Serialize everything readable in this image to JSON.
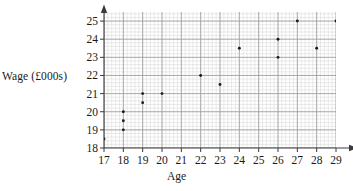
{
  "chart_data": {
    "type": "scatter",
    "title": "",
    "xlabel": "Age",
    "ylabel": "Wage (£000s)",
    "xlim": [
      17,
      29
    ],
    "ylim": [
      18,
      25.5
    ],
    "xticks": [
      17,
      18,
      19,
      20,
      21,
      22,
      23,
      24,
      25,
      26,
      27,
      28,
      29
    ],
    "yticks": [
      18,
      19,
      20,
      21,
      22,
      23,
      24,
      25
    ],
    "xtick_labels": [
      "17",
      "18",
      "19",
      "20",
      "21",
      "22",
      "23",
      "24",
      "25",
      "26",
      "27",
      "28",
      "29"
    ],
    "ytick_labels": [
      "18",
      "19",
      "20",
      "21",
      "22",
      "23",
      "24",
      "25"
    ],
    "grid": true,
    "minor_grid": true,
    "minor_subdivisions": 5,
    "legend": null,
    "marker": "dot",
    "marker_color": "#1a1a1a",
    "grid_major_color": "#9a9a9a",
    "grid_minor_color": "#d5d5d5",
    "axis_color": "#3a3a3a",
    "background_color": "#ffffff",
    "x": [
      17,
      18,
      18,
      18,
      19,
      19,
      20,
      22,
      23,
      24,
      26,
      26,
      27,
      28,
      29
    ],
    "y": [
      18.5,
      19,
      19.5,
      20,
      20.5,
      21,
      21,
      22,
      21.5,
      23.5,
      23,
      24,
      25,
      23.5,
      25
    ],
    "points": [
      {
        "age": 17,
        "wage": 18.5
      },
      {
        "age": 18,
        "wage": 19
      },
      {
        "age": 18,
        "wage": 19.5
      },
      {
        "age": 18,
        "wage": 20
      },
      {
        "age": 19,
        "wage": 20.5
      },
      {
        "age": 19,
        "wage": 21
      },
      {
        "age": 20,
        "wage": 21
      },
      {
        "age": 22,
        "wage": 22
      },
      {
        "age": 23,
        "wage": 21.5
      },
      {
        "age": 24,
        "wage": 23.5
      },
      {
        "age": 26,
        "wage": 23
      },
      {
        "age": 26,
        "wage": 24
      },
      {
        "age": 27,
        "wage": 25
      },
      {
        "age": 28,
        "wage": 23.5
      },
      {
        "age": 29,
        "wage": 25
      }
    ]
  }
}
